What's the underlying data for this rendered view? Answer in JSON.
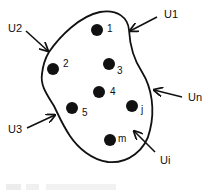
{
  "diagram": {
    "title": "",
    "region": {
      "shape": "closed-blob",
      "stroke": "#111111"
    },
    "points": [
      {
        "id": "1",
        "label": "1",
        "x": 97,
        "y": 30
      },
      {
        "id": "2",
        "label": "2",
        "x": 53,
        "y": 69
      },
      {
        "id": "3",
        "label": "3",
        "x": 109,
        "y": 64
      },
      {
        "id": "4",
        "label": "4",
        "x": 99,
        "y": 92
      },
      {
        "id": "5",
        "label": "5",
        "x": 72,
        "y": 108
      },
      {
        "id": "j",
        "label": "j",
        "x": 132,
        "y": 106
      },
      {
        "id": "m",
        "label": "m",
        "x": 110,
        "y": 140
      }
    ],
    "inputs": [
      {
        "id": "U1",
        "label": "U1"
      },
      {
        "id": "U2",
        "label": "U2"
      },
      {
        "id": "Un",
        "label": "Un"
      },
      {
        "id": "U3",
        "label": "U3"
      },
      {
        "id": "Ui",
        "label": "Ui"
      }
    ],
    "colors": {
      "ink": "#111111",
      "background": "#ffffff"
    }
  }
}
